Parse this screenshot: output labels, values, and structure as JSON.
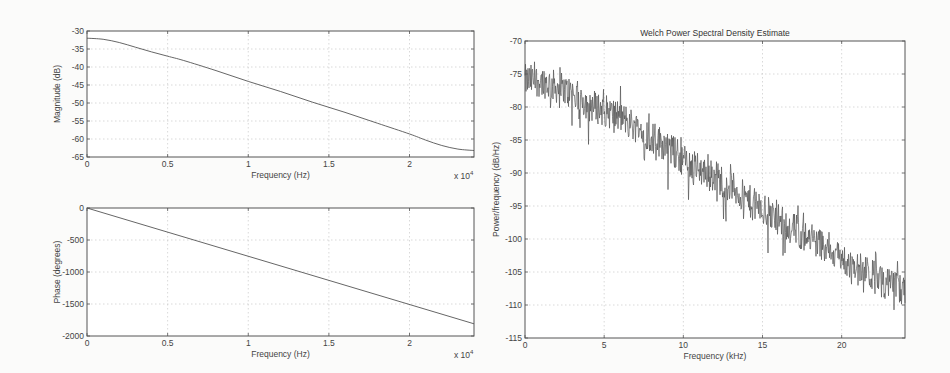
{
  "figure": {
    "background": "#fbfbfa",
    "line_color": "#555555"
  },
  "chart_data": [
    {
      "type": "line",
      "name": "magnitude",
      "title": "",
      "xlabel": "Frequency (Hz)",
      "ylabel": "Magnitude (dB)",
      "x_multiplier": "x 10",
      "x_exponent": "4",
      "xlim": [
        0,
        2.4
      ],
      "ylim": [
        -65,
        -30
      ],
      "xticks": [
        "0",
        "0.5",
        "1",
        "1.5",
        "2"
      ],
      "xtick_values": [
        0,
        0.5,
        1,
        1.5,
        2
      ],
      "yticks": [
        "-30",
        "-35",
        "-40",
        "-45",
        "-50",
        "-55",
        "-60",
        "-65"
      ],
      "ytick_values": [
        -30,
        -35,
        -40,
        -45,
        -50,
        -55,
        -60,
        -65
      ],
      "grid": true,
      "x": [
        0,
        0.1,
        0.2,
        0.3,
        0.4,
        0.5,
        0.6,
        0.8,
        1.0,
        1.2,
        1.4,
        1.6,
        1.8,
        2.0,
        2.1,
        2.2,
        2.3,
        2.4
      ],
      "y": [
        -32,
        -32.3,
        -33.2,
        -34.5,
        -35.8,
        -37.0,
        -38.2,
        -41.0,
        -44.0,
        -46.8,
        -49.8,
        -52.6,
        -55.6,
        -58.6,
        -60.3,
        -61.8,
        -62.8,
        -63.2
      ]
    },
    {
      "type": "line",
      "name": "phase",
      "title": "",
      "xlabel": "Frequency (Hz)",
      "ylabel": "Phase (degrees)",
      "x_multiplier": "x 10",
      "x_exponent": "4",
      "xlim": [
        0,
        2.4
      ],
      "ylim": [
        -2000,
        0
      ],
      "xticks": [
        "0",
        "0.5",
        "1",
        "1.5",
        "2"
      ],
      "xtick_values": [
        0,
        0.5,
        1,
        1.5,
        2
      ],
      "yticks": [
        "0",
        "-500",
        "-1000",
        "-1500",
        "-2000"
      ],
      "ytick_values": [
        0,
        -500,
        -1000,
        -1500,
        -2000
      ],
      "grid": true,
      "x": [
        0,
        2.4
      ],
      "y": [
        0,
        -1810
      ]
    },
    {
      "type": "line",
      "name": "welch-psd",
      "title": "Welch Power Spectral Density Estimate",
      "xlabel": "Frequency (kHz)",
      "ylabel": "Power/frequency (dB/Hz)",
      "xlim": [
        0,
        24
      ],
      "ylim": [
        -115,
        -70
      ],
      "xticks": [
        "0",
        "5",
        "10",
        "15",
        "20"
      ],
      "xtick_values": [
        0,
        5,
        10,
        15,
        20
      ],
      "yticks": [
        "-70",
        "-75",
        "-80",
        "-85",
        "-90",
        "-95",
        "-100",
        "-105",
        "-110",
        "-115"
      ],
      "ytick_values": [
        -70,
        -75,
        -80,
        -85,
        -90,
        -95,
        -100,
        -105,
        -110,
        -115
      ],
      "grid": true,
      "trend_x": [
        0,
        1,
        2,
        3,
        4,
        5,
        6,
        7,
        8,
        9,
        10,
        11,
        12,
        13,
        14,
        15,
        16,
        17,
        18,
        19,
        20,
        21,
        22,
        23,
        24
      ],
      "trend_y": [
        -76,
        -76,
        -77,
        -78,
        -79.5,
        -80.5,
        -81.5,
        -83,
        -84.5,
        -86,
        -88,
        -89.5,
        -90.5,
        -92,
        -94,
        -95.5,
        -97,
        -98.5,
        -100,
        -101,
        -103,
        -104.5,
        -105.5,
        -107,
        -108
      ],
      "noise_amplitude_db": 2.5,
      "peak_max": -73,
      "min_near_end": -110
    }
  ]
}
